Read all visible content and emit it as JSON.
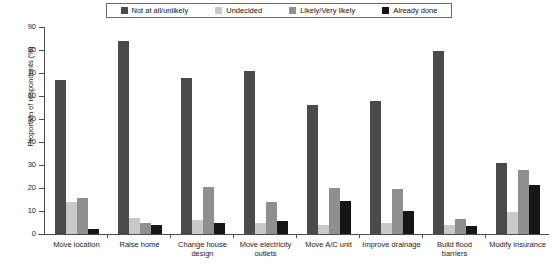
{
  "chart_data": {
    "type": "bar",
    "title": "",
    "xlabel": "",
    "ylabel": "Proportion of respondents (%)",
    "ylim": [
      0,
      90
    ],
    "ytick_step": 10,
    "yticks": [
      0,
      10,
      20,
      30,
      40,
      50,
      60,
      70,
      80,
      90
    ],
    "grid": false,
    "legend_position": "top-center",
    "categories": [
      "Move location",
      "Raise home",
      "Change house design",
      "Move electricity outlets",
      "Move A/C unit",
      "Improve drainage",
      "Build flood barriers",
      "Modify insurance"
    ],
    "series": [
      {
        "name": "Not at all/unlikely",
        "color": "#4a4a4a",
        "values": [
          67,
          84,
          68,
          71,
          56,
          58,
          79.5,
          31
        ]
      },
      {
        "name": "Undecided",
        "color": "#c9c9c9",
        "values": [
          14,
          7,
          6,
          5,
          4,
          5,
          4,
          9.5
        ]
      },
      {
        "name": "Likely/Very likely",
        "color": "#8f8f8f",
        "values": [
          15.5,
          5,
          20.5,
          14,
          20,
          19.5,
          6.5,
          28
        ]
      },
      {
        "name": "Already done",
        "color": "#161616",
        "values": [
          2,
          4,
          5,
          5.5,
          14.5,
          10,
          3.5,
          21.5
        ]
      }
    ]
  },
  "legend": {
    "items": [
      {
        "label": "Not at all/unlikely",
        "color": "#4a4a4a"
      },
      {
        "label": "Undecided",
        "color": "#c9c9c9"
      },
      {
        "label": "Likely/Very likely",
        "color": "#8f8f8f"
      },
      {
        "label": "Already done",
        "color": "#161616"
      }
    ]
  }
}
